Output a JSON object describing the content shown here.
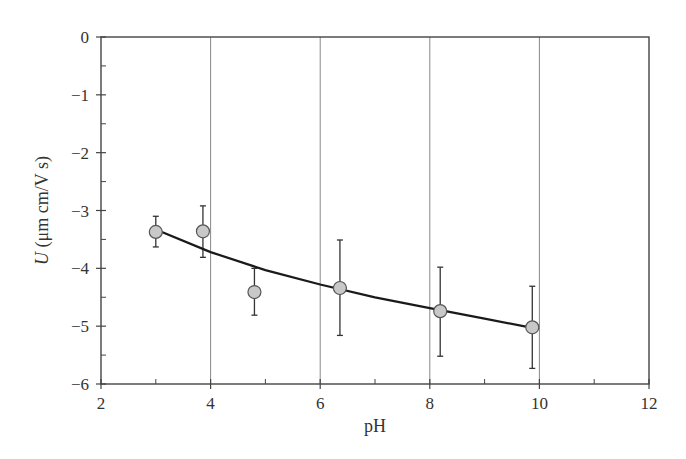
{
  "chart_data": {
    "type": "scatter",
    "title": "",
    "xlabel": "pH",
    "ylabel_italic": "U",
    "ylabel_rest": " (μm cm/V s)",
    "xlim": [
      2,
      12
    ],
    "ylim": [
      -6,
      0
    ],
    "x_ticks": [
      2,
      4,
      6,
      8,
      10,
      12
    ],
    "y_ticks": [
      0,
      -1,
      -2,
      -3,
      -4,
      -5,
      -6
    ],
    "x_tick_labels": [
      "2",
      "4",
      "6",
      "8",
      "10",
      "12"
    ],
    "y_tick_labels": [
      "0",
      "−1",
      "−2",
      "−3",
      "−4",
      "−5",
      "−6"
    ],
    "x_minor_ticks": [
      3,
      5,
      7,
      9,
      11
    ],
    "y_minor_ticks": [
      -0.5,
      -1.5,
      -2.5,
      -3.5,
      -4.5,
      -5.5
    ],
    "vertical_gridlines": [
      4,
      6,
      8,
      10
    ],
    "grid": "vertical only",
    "legend": null,
    "series": [
      {
        "name": "measured",
        "marker": "circle",
        "marker_fill": "#c8c8c8",
        "marker_edge": "#555555",
        "points": [
          {
            "x": 3.0,
            "y": -3.37,
            "err_low": -3.63,
            "err_high": -3.1
          },
          {
            "x": 3.86,
            "y": -3.36,
            "err_low": -3.81,
            "err_high": -2.92
          },
          {
            "x": 4.8,
            "y": -4.41,
            "err_low": -4.81,
            "err_high": -4.0
          },
          {
            "x": 6.36,
            "y": -4.34,
            "err_low": -5.16,
            "err_high": -3.51
          },
          {
            "x": 8.19,
            "y": -4.74,
            "err_low": -5.52,
            "err_high": -3.98
          },
          {
            "x": 9.87,
            "y": -5.02,
            "err_low": -5.73,
            "err_high": -4.31
          }
        ]
      },
      {
        "name": "fit",
        "type": "line",
        "color": "#1a1a1a",
        "points": [
          {
            "x": 3.0,
            "y": -3.33
          },
          {
            "x": 4.0,
            "y": -3.72
          },
          {
            "x": 5.0,
            "y": -4.03
          },
          {
            "x": 6.0,
            "y": -4.28
          },
          {
            "x": 7.0,
            "y": -4.5
          },
          {
            "x": 8.0,
            "y": -4.69
          },
          {
            "x": 9.0,
            "y": -4.87
          },
          {
            "x": 9.87,
            "y": -5.03
          }
        ]
      }
    ]
  }
}
